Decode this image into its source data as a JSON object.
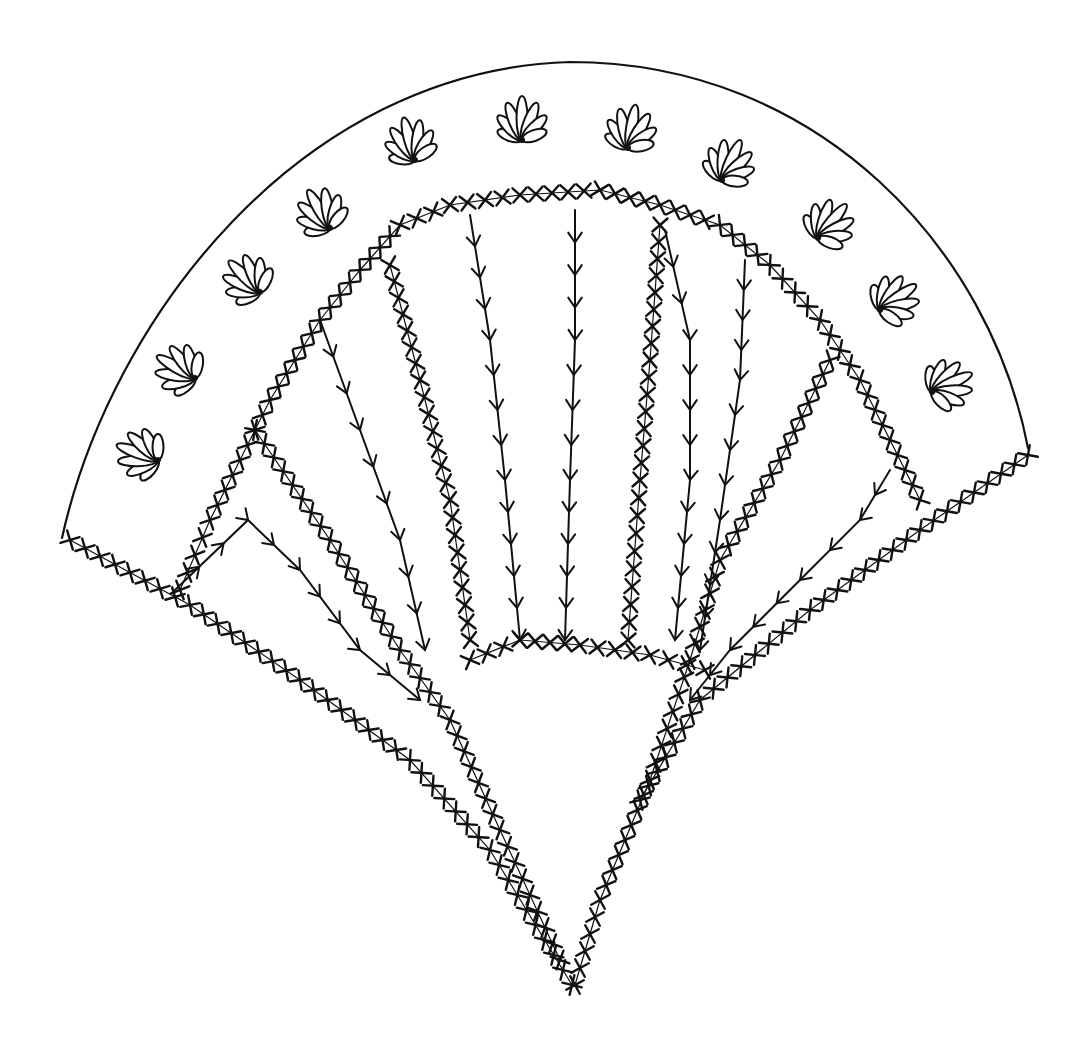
{
  "figure": {
    "stroke_color": "#111111",
    "background": "#ffffff",
    "outer_arc": {
      "left": [
        62,
        538
      ],
      "right": [
        1028,
        448
      ],
      "top_y": 60
    },
    "point": [
      572,
      985
    ],
    "flowers": [
      [
        158,
        460,
        -70
      ],
      [
        195,
        378,
        -60
      ],
      [
        260,
        292,
        -45
      ],
      [
        330,
        228,
        -30
      ],
      [
        415,
        160,
        -15
      ],
      [
        522,
        140,
        0
      ],
      [
        628,
        148,
        10
      ],
      [
        722,
        180,
        25
      ],
      [
        818,
        238,
        40
      ],
      [
        880,
        310,
        55
      ],
      [
        932,
        392,
        65
      ]
    ],
    "sprig_lines": [
      [
        [
          175,
          590
        ],
        [
          248,
          520
        ],
        [
          300,
          570
        ],
        [
          360,
          650
        ],
        [
          420,
          700
        ]
      ],
      [
        [
          320,
          320
        ],
        [
          360,
          430
        ],
        [
          400,
          540
        ],
        [
          425,
          650
        ]
      ],
      [
        [
          470,
          215
        ],
        [
          490,
          340
        ],
        [
          505,
          480
        ],
        [
          520,
          640
        ]
      ],
      [
        [
          575,
          210
        ],
        [
          575,
          340
        ],
        [
          570,
          480
        ],
        [
          565,
          640
        ]
      ],
      [
        [
          665,
          230
        ],
        [
          690,
          340
        ],
        [
          690,
          480
        ],
        [
          675,
          640
        ]
      ],
      [
        [
          745,
          260
        ],
        [
          740,
          380
        ],
        [
          720,
          520
        ],
        [
          700,
          650
        ]
      ],
      [
        [
          890,
          470
        ],
        [
          860,
          520
        ],
        [
          800,
          580
        ],
        [
          730,
          650
        ],
        [
          690,
          700
        ]
      ]
    ],
    "cross_lines": [
      [
        [
          70,
          540
        ],
        [
          190,
          605
        ],
        [
          300,
          680
        ],
        [
          410,
          760
        ],
        [
          490,
          850
        ],
        [
          572,
          985
        ]
      ],
      [
        [
          255,
          430
        ],
        [
          330,
          540
        ],
        [
          400,
          650
        ],
        [
          450,
          720
        ],
        [
          500,
          830
        ],
        [
          560,
          960
        ]
      ],
      [
        [
          390,
          265
        ],
        [
          420,
          380
        ],
        [
          450,
          500
        ],
        [
          470,
          640
        ]
      ],
      [
        [
          660,
          225
        ],
        [
          650,
          360
        ],
        [
          640,
          480
        ],
        [
          628,
          640
        ]
      ],
      [
        [
          830,
          360
        ],
        [
          780,
          460
        ],
        [
          720,
          560
        ],
        [
          690,
          660
        ],
        [
          650,
          780
        ],
        [
          600,
          900
        ],
        [
          575,
          985
        ]
      ],
      [
        [
          1028,
          455
        ],
        [
          920,
          530
        ],
        [
          810,
          610
        ],
        [
          700,
          700
        ],
        [
          640,
          800
        ]
      ],
      [
        [
          470,
          660
        ],
        [
          520,
          640
        ],
        [
          580,
          645
        ],
        [
          650,
          655
        ],
        [
          705,
          670
        ]
      ],
      [
        [
          180,
          590
        ],
        [
          210,
          520
        ],
        [
          240,
          460
        ],
        [
          270,
          400
        ],
        [
          320,
          320
        ],
        [
          360,
          270
        ],
        [
          400,
          225
        ],
        [
          450,
          205
        ],
        [
          520,
          195
        ],
        [
          600,
          190
        ],
        [
          660,
          205
        ],
        [
          720,
          225
        ],
        [
          770,
          265
        ],
        [
          820,
          320
        ],
        [
          860,
          380
        ],
        [
          890,
          440
        ],
        [
          920,
          500
        ]
      ]
    ]
  }
}
